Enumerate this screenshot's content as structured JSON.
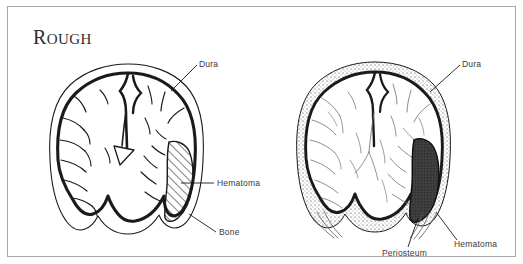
{
  "figure": {
    "width": 523,
    "height": 264,
    "background_color": "#ffffff",
    "frame_color": "#a8a8a8",
    "ink_color": "#1a1a1a",
    "label_color": "#3a3a3a",
    "hematoma_fill_color": "#3d3d3d",
    "caption_font_style": "small-caps-serif"
  },
  "panels": [
    {
      "id": "rough",
      "title": "Rough",
      "title_first_letter": "R",
      "title_rest": "OUGH",
      "hematoma_style": "diagonal-hatching",
      "labels": [
        {
          "name": "dura",
          "text": "Dura"
        },
        {
          "name": "hematoma",
          "text": "Hematoma"
        },
        {
          "name": "bone",
          "text": "Bone"
        }
      ]
    },
    {
      "id": "polished",
      "title": "Polished",
      "title_first_letter": "P",
      "title_rest": "OLISHED",
      "hematoma_style": "solid-dark-fill",
      "labels": [
        {
          "name": "dura",
          "text": "Dura"
        },
        {
          "name": "hematoma",
          "text": "Hematoma"
        },
        {
          "name": "periosteum",
          "text": "Periosteum"
        }
      ]
    }
  ]
}
